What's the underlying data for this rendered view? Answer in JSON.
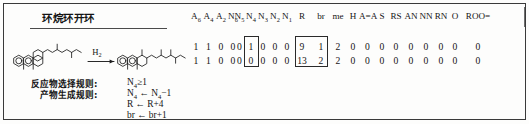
{
  "figure": {
    "reaction_title": "环烷环开环",
    "reagent_label": "H2"
  },
  "rules": {
    "labels": [
      "反应物选择规则:",
      "产物生成规则:"
    ],
    "expressions": [
      "N4≥1",
      "N4←N4−1",
      "R←R+4",
      "br←br+1"
    ]
  },
  "matrix": {
    "columns": [
      "A6",
      "A4",
      "A2",
      "N6",
      "N5",
      "N4",
      "N3",
      "N2",
      "N1",
      "R",
      "br",
      "me",
      "H",
      "A=A",
      "S",
      "RS",
      "AN",
      "NN",
      "RN",
      "O",
      "ROO="
    ],
    "rows": [
      {
        "name": "reactant-row",
        "values": [
          "1",
          "1",
          "0",
          "0",
          "0",
          "1",
          "0",
          "0",
          "0",
          "9",
          "1",
          "2",
          "0",
          "0",
          "0",
          "0",
          "0",
          "0",
          "0",
          "0",
          "0"
        ]
      },
      {
        "name": "product-row",
        "values": [
          "1",
          "1",
          "0",
          "0",
          "0",
          "0",
          "0",
          "0",
          "0",
          "13",
          "2",
          "2",
          "0",
          "0",
          "0",
          "0",
          "0",
          "0",
          "0",
          "0",
          "0"
        ]
      }
    ],
    "highlighted_columns": [
      "N4",
      "R",
      "br"
    ]
  },
  "colors": {
    "ink": "#141414",
    "frame": "#3a3a3a",
    "paper": "#fdfdfc"
  }
}
